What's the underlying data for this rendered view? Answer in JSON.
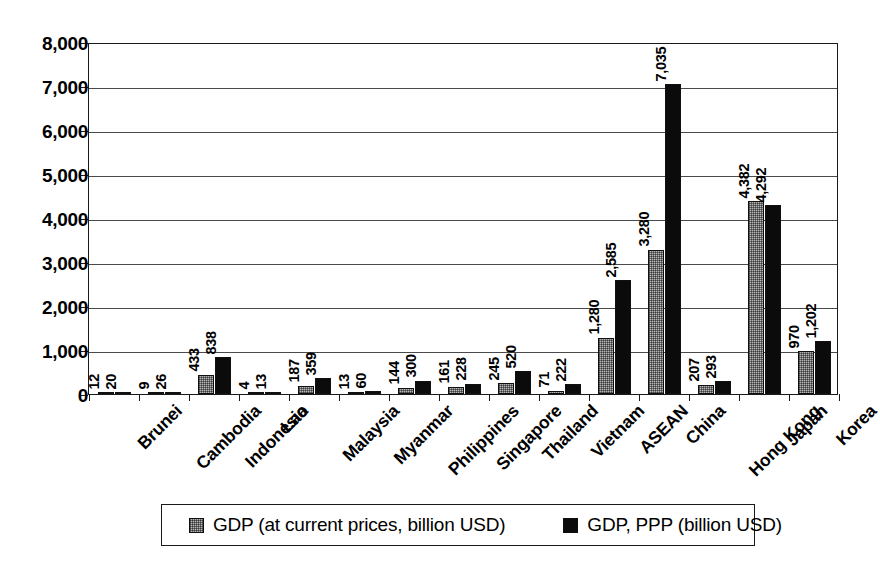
{
  "chart_data": {
    "type": "bar",
    "title": "",
    "xlabel": "",
    "ylabel": "",
    "ylim": [
      0,
      8000
    ],
    "ytick_labels": [
      "0",
      "1,000",
      "2,000",
      "3,000",
      "4,000",
      "5,000",
      "6,000",
      "7,000",
      "8,000"
    ],
    "ytick_values": [
      0,
      1000,
      2000,
      3000,
      4000,
      5000,
      6000,
      7000,
      8000
    ],
    "grid": true,
    "legend_position": "bottom",
    "categories": [
      "Brunei",
      "Cambodia",
      "Indonesia",
      "Lao",
      "Malaysia",
      "Myanmar",
      "Philippines",
      "Singapore",
      "Thailand",
      "Vietnam",
      "ASEAN",
      "China",
      "Hong Kong",
      "Japan",
      "Korea"
    ],
    "series": [
      {
        "name": "GDP (at current prices, billion USD)",
        "color": "#b9b9b9",
        "values": [
          12,
          9,
          433,
          4,
          187,
          13,
          144,
          161,
          245,
          71,
          1280,
          3280,
          207,
          4382,
          970
        ],
        "value_labels": [
          "12",
          "9",
          "433",
          "4",
          "187",
          "13",
          "144",
          "161",
          "245",
          "71",
          "1,280",
          "3,280",
          "207",
          "4,382",
          "970"
        ]
      },
      {
        "name": "GDP, PPP (billion USD)",
        "color": "#0b0b0b",
        "values": [
          20,
          26,
          838,
          13,
          359,
          60,
          300,
          228,
          520,
          222,
          2585,
          7035,
          293,
          4292,
          1202
        ],
        "value_labels": [
          "20",
          "26",
          "838",
          "13",
          "359",
          "60",
          "300",
          "228",
          "520",
          "222",
          "2,585",
          "7,035",
          "293",
          "4,292",
          "1,202"
        ]
      }
    ]
  },
  "legend": {
    "items": [
      {
        "label": "GDP (at current prices, billion USD)",
        "swatch": "gray-checkered-swatch"
      },
      {
        "label": "GDP, PPP (billion USD)",
        "swatch": "black-swatch"
      }
    ]
  }
}
